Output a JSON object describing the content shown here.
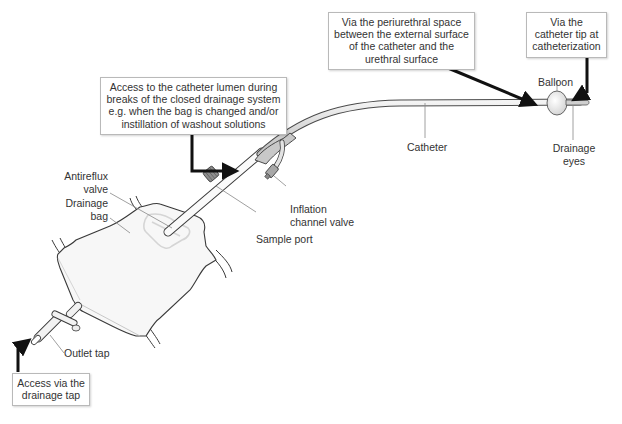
{
  "diagram": {
    "type": "urinary catheter drainage system - routes of bacterial entry",
    "callouts": {
      "lumen_access": [
        "Access to the catheter lumen during",
        "breaks of the closed drainage system",
        "e.g. when the bag is changed and/or",
        "instillation of washout solutions"
      ],
      "periurethral": [
        "Via the periurethral space",
        "between the external surface",
        "of the catheter and the",
        "urethral surface"
      ],
      "catheter_tip": [
        "Via the",
        "catheter tip at",
        "catheterization"
      ],
      "drainage_tap": [
        "Access via the",
        "drainage tap"
      ]
    },
    "labels": {
      "antireflux_valve": [
        "Antireflux",
        "valve"
      ],
      "drainage_bag": [
        "Drainage",
        "bag"
      ],
      "sample_port": "Sample port",
      "inflation_channel_valve": [
        "Inflation",
        "channel valve"
      ],
      "catheter": "Catheter",
      "balloon": "Balloon",
      "drainage_eyes": [
        "Drainage",
        "eyes"
      ],
      "outlet_tap": "Outlet tap"
    },
    "colors": {
      "arrow": "#111111",
      "outline": "#3a3a3a",
      "leader": "#888888",
      "tube_fill": "#e6e6e6",
      "box_border": "#b9b9b9"
    }
  }
}
